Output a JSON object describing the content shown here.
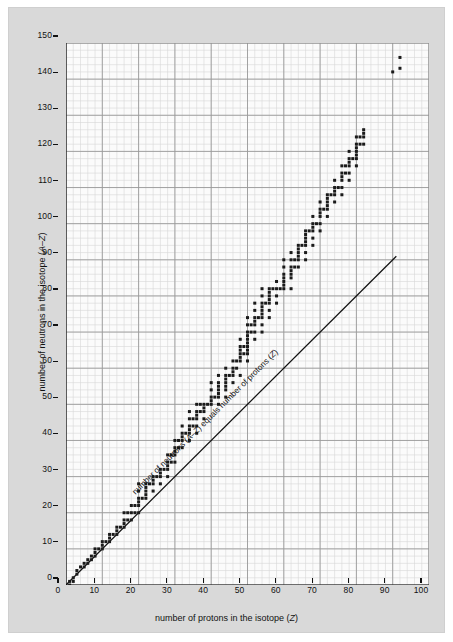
{
  "figure": {
    "background_color": "#d9d9d9",
    "plot_background_color": "#fbfbfb",
    "axis_color": "#111111",
    "point_color": "#1a1a1a",
    "major_grid_color": "#9a9a9a",
    "minor_grid_color": "#d6d6d6"
  },
  "axes": {
    "x_title_plain": "number of protons in the isotope (Z)",
    "x_title_pre": "number of protons in the isotope (",
    "x_title_italic": "Z",
    "x_title_post": ")",
    "y_title_plain": "number of neutrons in the isotope (A–Z)",
    "y_title_pre": "number of neutrons in the isotope (",
    "y_title_italic_a": "A",
    "y_title_dash": "–",
    "y_title_italic_z": "Z",
    "y_title_post": ")"
  },
  "annotation": {
    "line_label_plain": "number of neutrons (A–Z) equals number of protons (Z)",
    "line_label_pre": "number of neutrons (",
    "line_label_a": "A",
    "line_label_dash": "–",
    "line_label_z1": "Z",
    "line_label_mid": ") equals number of protons (",
    "line_label_z2": "Z",
    "line_label_post": ")"
  },
  "chart_data": {
    "type": "scatter",
    "title": "",
    "subtitle": "",
    "xlabel": "number of protons in the isotope (Z)",
    "ylabel": "number of neutrons in the isotope (A–Z)",
    "xlim": [
      0,
      100
    ],
    "ylim": [
      0,
      150
    ],
    "x_major_ticks": [
      0,
      10,
      20,
      30,
      40,
      50,
      60,
      70,
      80,
      90,
      100
    ],
    "y_major_ticks": [
      0,
      10,
      20,
      30,
      40,
      50,
      60,
      70,
      80,
      90,
      100,
      110,
      120,
      130,
      140,
      150
    ],
    "x_tick_labels": [
      "0",
      "10",
      "20",
      "30",
      "40",
      "50",
      "60",
      "70",
      "80",
      "90",
      "100"
    ],
    "y_tick_labels": [
      "0",
      "10",
      "20",
      "30",
      "40",
      "50",
      "60",
      "70",
      "80",
      "90",
      "100",
      "110",
      "120",
      "130",
      "140",
      "150"
    ],
    "x_minor_step": 2,
    "y_minor_step": 2,
    "grid": true,
    "legend": false,
    "marker": "square",
    "marker_size_px": 3,
    "reference_line": {
      "label": "number of neutrons (A–Z) equals number of protons (Z)",
      "equation": "N = Z",
      "slope": 1,
      "intercept": 0,
      "x_start": 0,
      "y_start": 0,
      "x_end": 91,
      "y_end": 91
    },
    "series": [
      {
        "name": "stable isotopes",
        "points": [
          [
            1,
            0
          ],
          [
            1,
            1
          ],
          [
            2,
            1
          ],
          [
            2,
            2
          ],
          [
            3,
            3
          ],
          [
            3,
            4
          ],
          [
            4,
            5
          ],
          [
            5,
            5
          ],
          [
            5,
            6
          ],
          [
            6,
            6
          ],
          [
            6,
            7
          ],
          [
            7,
            7
          ],
          [
            7,
            8
          ],
          [
            8,
            8
          ],
          [
            8,
            9
          ],
          [
            8,
            10
          ],
          [
            9,
            10
          ],
          [
            10,
            10
          ],
          [
            10,
            11
          ],
          [
            10,
            12
          ],
          [
            11,
            12
          ],
          [
            12,
            12
          ],
          [
            12,
            13
          ],
          [
            12,
            14
          ],
          [
            13,
            14
          ],
          [
            14,
            14
          ],
          [
            14,
            15
          ],
          [
            14,
            16
          ],
          [
            15,
            16
          ],
          [
            16,
            16
          ],
          [
            16,
            17
          ],
          [
            16,
            18
          ],
          [
            16,
            20
          ],
          [
            17,
            18
          ],
          [
            17,
            20
          ],
          [
            18,
            18
          ],
          [
            18,
            20
          ],
          [
            18,
            22
          ],
          [
            19,
            20
          ],
          [
            19,
            22
          ],
          [
            20,
            20
          ],
          [
            20,
            22
          ],
          [
            20,
            23
          ],
          [
            20,
            24
          ],
          [
            20,
            26
          ],
          [
            20,
            28
          ],
          [
            21,
            24
          ],
          [
            22,
            24
          ],
          [
            22,
            25
          ],
          [
            22,
            26
          ],
          [
            22,
            27
          ],
          [
            22,
            28
          ],
          [
            23,
            28
          ],
          [
            24,
            26
          ],
          [
            24,
            28
          ],
          [
            24,
            29
          ],
          [
            24,
            30
          ],
          [
            25,
            30
          ],
          [
            26,
            28
          ],
          [
            26,
            30
          ],
          [
            26,
            31
          ],
          [
            26,
            32
          ],
          [
            27,
            32
          ],
          [
            28,
            30
          ],
          [
            28,
            32
          ],
          [
            28,
            33
          ],
          [
            28,
            34
          ],
          [
            28,
            36
          ],
          [
            29,
            34
          ],
          [
            29,
            36
          ],
          [
            30,
            34
          ],
          [
            30,
            36
          ],
          [
            30,
            37
          ],
          [
            30,
            38
          ],
          [
            30,
            40
          ],
          [
            31,
            38
          ],
          [
            31,
            40
          ],
          [
            32,
            38
          ],
          [
            32,
            40
          ],
          [
            32,
            41
          ],
          [
            32,
            42
          ],
          [
            32,
            44
          ],
          [
            33,
            42
          ],
          [
            34,
            40
          ],
          [
            34,
            42
          ],
          [
            34,
            43
          ],
          [
            34,
            44
          ],
          [
            34,
            46
          ],
          [
            34,
            48
          ],
          [
            35,
            44
          ],
          [
            35,
            46
          ],
          [
            36,
            42
          ],
          [
            36,
            44
          ],
          [
            36,
            46
          ],
          [
            36,
            47
          ],
          [
            36,
            48
          ],
          [
            36,
            50
          ],
          [
            37,
            48
          ],
          [
            37,
            50
          ],
          [
            38,
            46
          ],
          [
            38,
            48
          ],
          [
            38,
            49
          ],
          [
            38,
            50
          ],
          [
            39,
            50
          ],
          [
            40,
            50
          ],
          [
            40,
            51
          ],
          [
            40,
            52
          ],
          [
            40,
            54
          ],
          [
            40,
            56
          ],
          [
            41,
            52
          ],
          [
            42,
            50
          ],
          [
            42,
            52
          ],
          [
            42,
            53
          ],
          [
            42,
            54
          ],
          [
            42,
            55
          ],
          [
            42,
            56
          ],
          [
            42,
            58
          ],
          [
            44,
            52
          ],
          [
            44,
            54
          ],
          [
            44,
            55
          ],
          [
            44,
            56
          ],
          [
            44,
            57
          ],
          [
            44,
            58
          ],
          [
            44,
            60
          ],
          [
            45,
            58
          ],
          [
            46,
            56
          ],
          [
            46,
            58
          ],
          [
            46,
            59
          ],
          [
            46,
            60
          ],
          [
            46,
            62
          ],
          [
            47,
            60
          ],
          [
            47,
            62
          ],
          [
            48,
            58
          ],
          [
            48,
            62
          ],
          [
            48,
            63
          ],
          [
            48,
            64
          ],
          [
            48,
            65
          ],
          [
            48,
            66
          ],
          [
            48,
            68
          ],
          [
            49,
            64
          ],
          [
            49,
            66
          ],
          [
            50,
            62
          ],
          [
            50,
            64
          ],
          [
            50,
            65
          ],
          [
            50,
            66
          ],
          [
            50,
            67
          ],
          [
            50,
            68
          ],
          [
            50,
            69
          ],
          [
            50,
            70
          ],
          [
            50,
            72
          ],
          [
            50,
            74
          ],
          [
            51,
            70
          ],
          [
            51,
            72
          ],
          [
            52,
            68
          ],
          [
            52,
            70
          ],
          [
            52,
            72
          ],
          [
            52,
            73
          ],
          [
            52,
            74
          ],
          [
            52,
            76
          ],
          [
            52,
            78
          ],
          [
            53,
            74
          ],
          [
            54,
            70
          ],
          [
            54,
            72
          ],
          [
            54,
            74
          ],
          [
            54,
            75
          ],
          [
            54,
            76
          ],
          [
            54,
            77
          ],
          [
            54,
            78
          ],
          [
            54,
            80
          ],
          [
            54,
            82
          ],
          [
            55,
            78
          ],
          [
            56,
            74
          ],
          [
            56,
            76
          ],
          [
            56,
            78
          ],
          [
            56,
            79
          ],
          [
            56,
            80
          ],
          [
            56,
            81
          ],
          [
            56,
            82
          ],
          [
            57,
            82
          ],
          [
            58,
            78
          ],
          [
            58,
            80
          ],
          [
            58,
            82
          ],
          [
            58,
            84
          ],
          [
            59,
            82
          ],
          [
            60,
            82
          ],
          [
            60,
            83
          ],
          [
            60,
            84
          ],
          [
            60,
            85
          ],
          [
            60,
            86
          ],
          [
            60,
            88
          ],
          [
            60,
            90
          ],
          [
            62,
            82
          ],
          [
            62,
            85
          ],
          [
            62,
            86
          ],
          [
            62,
            87
          ],
          [
            62,
            88
          ],
          [
            62,
            90
          ],
          [
            62,
            92
          ],
          [
            63,
            88
          ],
          [
            63,
            90
          ],
          [
            64,
            88
          ],
          [
            64,
            90
          ],
          [
            64,
            91
          ],
          [
            64,
            92
          ],
          [
            64,
            93
          ],
          [
            64,
            94
          ],
          [
            65,
            94
          ],
          [
            66,
            90
          ],
          [
            66,
            92
          ],
          [
            66,
            94
          ],
          [
            66,
            95
          ],
          [
            66,
            96
          ],
          [
            66,
            97
          ],
          [
            66,
            98
          ],
          [
            67,
            98
          ],
          [
            68,
            94
          ],
          [
            68,
            96
          ],
          [
            68,
            98
          ],
          [
            68,
            99
          ],
          [
            68,
            100
          ],
          [
            68,
            102
          ],
          [
            69,
            100
          ],
          [
            70,
            98
          ],
          [
            70,
            100
          ],
          [
            70,
            102
          ],
          [
            70,
            103
          ],
          [
            70,
            104
          ],
          [
            70,
            106
          ],
          [
            71,
            104
          ],
          [
            72,
            102
          ],
          [
            72,
            104
          ],
          [
            72,
            105
          ],
          [
            72,
            106
          ],
          [
            72,
            107
          ],
          [
            72,
            108
          ],
          [
            73,
            108
          ],
          [
            74,
            106
          ],
          [
            74,
            108
          ],
          [
            74,
            109
          ],
          [
            74,
            110
          ],
          [
            74,
            112
          ],
          [
            75,
            110
          ],
          [
            76,
            108
          ],
          [
            76,
            110
          ],
          [
            76,
            112
          ],
          [
            76,
            113
          ],
          [
            76,
            114
          ],
          [
            76,
            116
          ],
          [
            77,
            114
          ],
          [
            77,
            116
          ],
          [
            78,
            112
          ],
          [
            78,
            114
          ],
          [
            78,
            116
          ],
          [
            78,
            117
          ],
          [
            78,
            118
          ],
          [
            78,
            120
          ],
          [
            79,
            118
          ],
          [
            80,
            116
          ],
          [
            80,
            118
          ],
          [
            80,
            119
          ],
          [
            80,
            120
          ],
          [
            80,
            121
          ],
          [
            80,
            122
          ],
          [
            80,
            124
          ],
          [
            81,
            122
          ],
          [
            81,
            124
          ],
          [
            82,
            122
          ],
          [
            82,
            124
          ],
          [
            82,
            125
          ],
          [
            82,
            126
          ],
          [
            90,
            142
          ],
          [
            92,
            143
          ],
          [
            92,
            146
          ]
        ]
      }
    ]
  }
}
